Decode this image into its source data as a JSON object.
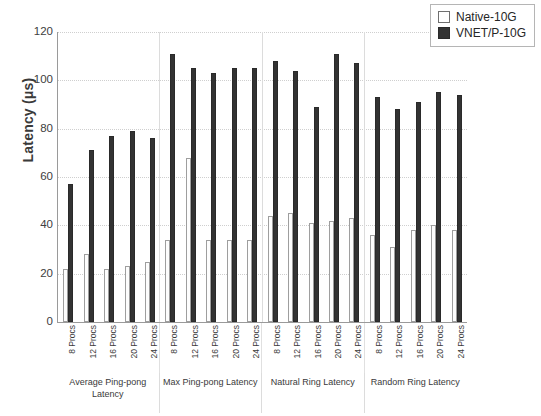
{
  "chart_data": {
    "type": "bar",
    "title": "",
    "xlabel": "",
    "ylabel": "Latency (μs)",
    "ylim": [
      0,
      120
    ],
    "yticks": [
      0,
      20,
      40,
      60,
      80,
      100,
      120
    ],
    "grid": true,
    "legend_position": "top-right",
    "categories": [
      "8 Procs",
      "12 Procs",
      "16 Procs",
      "20 Procs",
      "24 Procs"
    ],
    "groups": [
      {
        "label": "Average Ping-pong Latency",
        "series": [
          {
            "name": "Native-10G",
            "values": [
              22,
              28,
              22,
              23,
              25
            ]
          },
          {
            "name": "VNET/P-10G",
            "values": [
              57,
              71,
              77,
              79,
              76
            ]
          }
        ]
      },
      {
        "label": "Max Ping-pong Latency",
        "series": [
          {
            "name": "Native-10G",
            "values": [
              34,
              68,
              34,
              34,
              34
            ]
          },
          {
            "name": "VNET/P-10G",
            "values": [
              111,
              105,
              103,
              105,
              105
            ]
          }
        ]
      },
      {
        "label": "Natural Ring Latency",
        "series": [
          {
            "name": "Native-10G",
            "values": [
              44,
              45,
              41,
              42,
              43
            ]
          },
          {
            "name": "VNET/P-10G",
            "values": [
              108,
              104,
              89,
              111,
              107
            ]
          }
        ]
      },
      {
        "label": "Random Ring Latency",
        "series": [
          {
            "name": "Native-10G",
            "values": [
              36,
              31,
              38,
              40,
              38
            ]
          },
          {
            "name": "VNET/P-10G",
            "values": [
              93,
              88,
              91,
              95,
              94
            ]
          }
        ]
      }
    ],
    "series_colors": {
      "Native-10G": "#ffffff",
      "VNET/P-10G": "#333333"
    }
  },
  "legend": {
    "entries": [
      {
        "label": "Native-10G",
        "swatch": "hollow-square-swatch"
      },
      {
        "label": "VNET/P-10G",
        "swatch": "filled-square-swatch"
      }
    ]
  }
}
